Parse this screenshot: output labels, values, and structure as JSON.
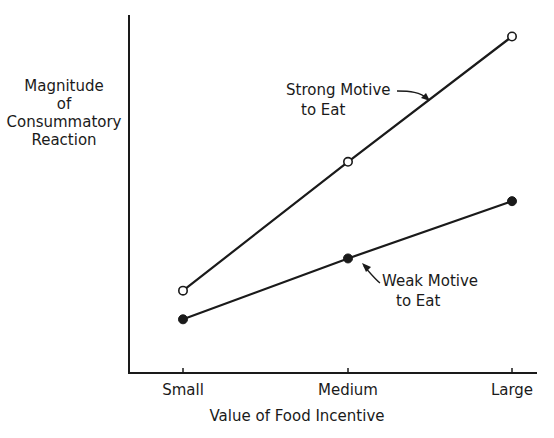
{
  "chart_data": {
    "type": "line",
    "title": "",
    "xlabel": "Value of Food Incentive",
    "ylabel": "Magnitude of Consummatory Reaction",
    "ylabel_lines": [
      "Magnitude",
      "of",
      "Consummatory",
      "Reaction"
    ],
    "categories": [
      "Small",
      "Medium",
      "Large"
    ],
    "ylim": [
      0,
      100
    ],
    "y_ticks_shown": false,
    "grid": false,
    "legend": "none (direct annotations with arrows)",
    "series": [
      {
        "name": "Strong Motive to Eat",
        "label_lines": [
          "Strong Motive",
          "to Eat"
        ],
        "marker": "open-circle",
        "values": [
          23,
          59,
          94
        ]
      },
      {
        "name": "Weak Motive to Eat",
        "label_lines": [
          "Weak Motive",
          "to Eat"
        ],
        "marker": "filled-circle",
        "values": [
          15,
          32,
          48
        ]
      }
    ],
    "line_color": "#1a1a1a",
    "background": "#ffffff"
  }
}
